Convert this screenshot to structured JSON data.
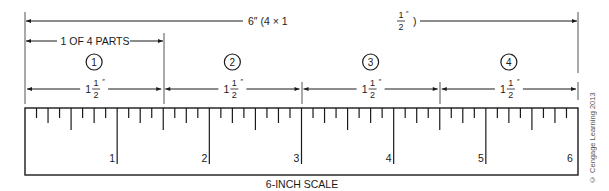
{
  "diagram": {
    "title": "6-INCH SCALE",
    "overall_dimension": {
      "label_prefix": "6″ (4 × 1",
      "frac_num": "1",
      "frac_den": "2",
      "label_suffix": ")",
      "inch_mark": "″"
    },
    "part_label": "1 OF 4 PARTS",
    "parts": [
      {
        "number": "1",
        "whole": "1",
        "frac_num": "1",
        "frac_den": "2",
        "inch_mark": "″"
      },
      {
        "number": "2",
        "whole": "1",
        "frac_num": "1",
        "frac_den": "2",
        "inch_mark": "″"
      },
      {
        "number": "3",
        "whole": "1",
        "frac_num": "1",
        "frac_den": "2",
        "inch_mark": "″"
      },
      {
        "number": "4",
        "whole": "1",
        "frac_num": "1",
        "frac_den": "2",
        "inch_mark": "″"
      }
    ],
    "ruler": {
      "inches": 6,
      "subdivisions_per_inch": 8,
      "labels": [
        "1",
        "2",
        "3",
        "4",
        "5",
        "6"
      ]
    },
    "copyright": "© Cengage Learning 2013",
    "colors": {
      "line": "#1a1a1a",
      "extension": "#555555"
    }
  }
}
